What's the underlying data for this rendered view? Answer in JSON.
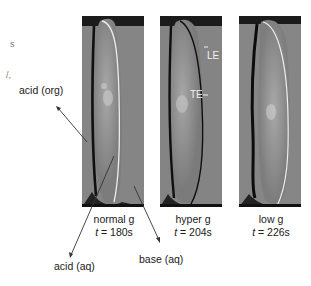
{
  "figure": {
    "left_fragments": [
      "s",
      "/,"
    ],
    "panels": [
      {
        "id": "normal",
        "condition": "normal g",
        "time_prefix": "t",
        "time_value": " = 180s"
      },
      {
        "id": "hyper",
        "condition": "hyper g",
        "time_prefix": "t",
        "time_value": " = 204s"
      },
      {
        "id": "low",
        "condition": "low g",
        "time_prefix": "t",
        "time_value": " = 226s"
      }
    ],
    "inset_labels": {
      "leading_edge": "LE",
      "trailing_edge": "TE"
    },
    "annotations": {
      "acid_org": "acid (org)",
      "acid_aq": "acid (aq)",
      "base_aq": "base (aq)"
    }
  }
}
